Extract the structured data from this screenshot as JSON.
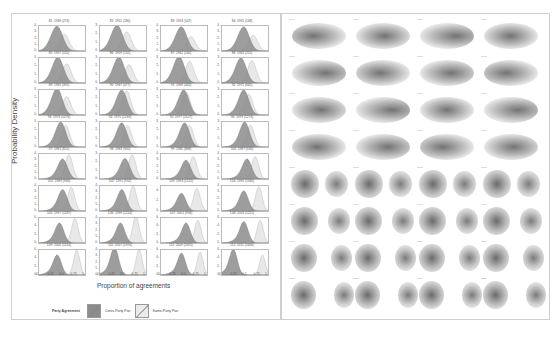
{
  "figure": {
    "left_panel_title": "Party agreement density by Congress",
    "right_panel_title": "Co-voting networks by Congress"
  },
  "chart_data": {
    "type": "area",
    "title": "",
    "xlabel": "Proportion of agreements",
    "ylabel": "Probability Density",
    "xlim": [
      0,
      1
    ],
    "xticks": [
      "0",
      "0.25",
      "0.5",
      "0.75",
      "1"
    ],
    "legend": {
      "title": "Party Agreement",
      "position": "bottom",
      "entries": [
        {
          "label": "Cross-Party Pair",
          "color": "#8c8c8c"
        },
        {
          "label": "Same-Party Pair",
          "color": "#e6e6e6"
        }
      ]
    },
    "panels": [
      {
        "label": "81: 1949 (274)",
        "ymax": 4,
        "cross_peak": 0.4,
        "same_peak": 0.55,
        "cross_h": 3.7,
        "same_h": 2.7
      },
      {
        "label": "82: 1951 (180)",
        "ymax": 3,
        "cross_peak": 0.38,
        "same_peak": 0.58,
        "cross_h": 2.9,
        "same_h": 2.3
      },
      {
        "label": "83: 1953 (147)",
        "ymax": 4,
        "cross_peak": 0.45,
        "same_peak": 0.65,
        "cross_h": 3.6,
        "same_h": 2.3
      },
      {
        "label": "84: 1955 (148)",
        "ymax": 4,
        "cross_peak": 0.48,
        "same_peak": 0.68,
        "cross_h": 3.6,
        "same_h": 2.5
      },
      {
        "label": "85: 1957 (155)",
        "ymax": 3,
        "cross_peak": 0.42,
        "same_peak": 0.6,
        "cross_h": 2.9,
        "same_h": 2.3
      },
      {
        "label": "86: 1959 (155)",
        "ymax": 3,
        "cross_peak": 0.42,
        "same_peak": 0.63,
        "cross_h": 2.9,
        "same_h": 2.2
      },
      {
        "label": "87: 1961 (240)",
        "ymax": 3,
        "cross_peak": 0.4,
        "same_peak": 0.62,
        "cross_h": 3.0,
        "same_h": 2.6
      },
      {
        "label": "88: 1963 (251)",
        "ymax": 3,
        "cross_peak": 0.42,
        "same_peak": 0.65,
        "cross_h": 2.8,
        "same_h": 2.7
      },
      {
        "label": "89: 1965 (395)",
        "ymax": 3,
        "cross_peak": 0.4,
        "same_peak": 0.6,
        "cross_h": 3.0,
        "same_h": 2.2
      },
      {
        "label": "90: 1967 (477)",
        "ymax": 3,
        "cross_peak": 0.48,
        "same_peak": 0.58,
        "cross_h": 2.8,
        "same_h": 2.9
      },
      {
        "label": "91: 1969 (443)",
        "ymax": 3,
        "cross_peak": 0.5,
        "same_peak": 0.55,
        "cross_h": 2.8,
        "same_h": 2.7
      },
      {
        "label": "92: 1971 (645)",
        "ymax": 3,
        "cross_peak": 0.48,
        "same_peak": 0.58,
        "cross_h": 2.8,
        "same_h": 2.5
      },
      {
        "label": "93: 1973 (1076)",
        "ymax": 3,
        "cross_peak": 0.48,
        "same_peak": 0.58,
        "cross_h": 2.8,
        "same_h": 2.6
      },
      {
        "label": "94: 1975 (1269)",
        "ymax": 3,
        "cross_peak": 0.48,
        "same_peak": 0.6,
        "cross_h": 2.7,
        "same_h": 2.6
      },
      {
        "label": "95: 1977 (1527)",
        "ymax": 3,
        "cross_peak": 0.52,
        "same_peak": 0.62,
        "cross_h": 2.7,
        "same_h": 2.6
      },
      {
        "label": "96: 1979 (1274)",
        "ymax": 3,
        "cross_peak": 0.5,
        "same_peak": 0.62,
        "cross_h": 2.8,
        "same_h": 2.6
      },
      {
        "label": "97: 1981 (811)",
        "ymax": 4,
        "cross_peak": 0.52,
        "same_peak": 0.65,
        "cross_h": 3.0,
        "same_h": 3.9
      },
      {
        "label": "98: 1983 (905)",
        "ymax": 3,
        "cross_peak": 0.55,
        "same_peak": 0.7,
        "cross_h": 2.3,
        "same_h": 2.9
      },
      {
        "label": "99: 1985 (888)",
        "ymax": 4,
        "cross_peak": 0.55,
        "same_peak": 0.7,
        "cross_h": 2.8,
        "same_h": 3.6
      },
      {
        "label": "100: 1987 (930)",
        "ymax": 4,
        "cross_peak": 0.55,
        "same_peak": 0.72,
        "cross_h": 3.0,
        "same_h": 3.6
      },
      {
        "label": "101: 1989 (966)",
        "ymax": 4,
        "cross_peak": 0.52,
        "same_peak": 0.7,
        "cross_h": 3.2,
        "same_h": 3.8
      },
      {
        "label": "102: 1991 (932)",
        "ymax": 4,
        "cross_peak": 0.48,
        "same_peak": 0.72,
        "cross_h": 3.2,
        "same_h": 4.0
      },
      {
        "label": "103: 1993 (1122)",
        "ymax": 5,
        "cross_peak": 0.45,
        "same_peak": 0.78,
        "cross_h": 3.3,
        "same_h": 4.5
      },
      {
        "label": "104: 1995 (1340)",
        "ymax": 4,
        "cross_peak": 0.48,
        "same_peak": 0.8,
        "cross_h": 3.0,
        "same_h": 3.9
      },
      {
        "label": "105: 1997 (1187)",
        "ymax": 6,
        "cross_peak": 0.45,
        "same_peak": 0.78,
        "cross_h": 4.5,
        "same_h": 5.9
      },
      {
        "label": "106: 1999 (1214)",
        "ymax": 4,
        "cross_peak": 0.45,
        "same_peak": 0.78,
        "cross_h": 3.0,
        "same_h": 4.3
      },
      {
        "label": "107: 2001 (996)",
        "ymax": 6,
        "cross_peak": 0.55,
        "same_peak": 0.8,
        "cross_h": 4.5,
        "same_h": 5.5
      },
      {
        "label": "108: 2003 (1221)",
        "ymax": 6,
        "cross_peak": 0.48,
        "same_peak": 0.83,
        "cross_h": 4.8,
        "same_h": 5.5
      },
      {
        "label": "109: 2005 (1214)",
        "ymax": 6,
        "cross_peak": 0.4,
        "same_peak": 0.82,
        "cross_h": 4.5,
        "same_h": 6.0
      },
      {
        "label": "110: 2007 (1876)",
        "ymax": 4,
        "cross_peak": 0.32,
        "same_peak": 0.85,
        "cross_h": 4.2,
        "same_h": 4.2
      },
      {
        "label": "111: 2009 (1655)",
        "ymax": 6,
        "cross_peak": 0.45,
        "same_peak": 0.85,
        "cross_h": 4.9,
        "same_h": 5.5
      },
      {
        "label": "112: 2011 (1606)",
        "ymax": 6,
        "cross_peak": 0.25,
        "same_peak": 0.88,
        "cross_h": 5.8,
        "same_h": 4.8
      }
    ]
  },
  "networks": {
    "labels": [
      "1949",
      "1951",
      "1953",
      "1955",
      "1957",
      "1959",
      "1961",
      "1963",
      "1965",
      "1967",
      "1969",
      "1971",
      "1973",
      "1975",
      "1977",
      "1979",
      "1981",
      "1983",
      "1985",
      "1987",
      "1989",
      "1991",
      "1993",
      "1995",
      "1997",
      "1999",
      "2001",
      "2003",
      "2005",
      "2007",
      "2009",
      "2011"
    ]
  }
}
